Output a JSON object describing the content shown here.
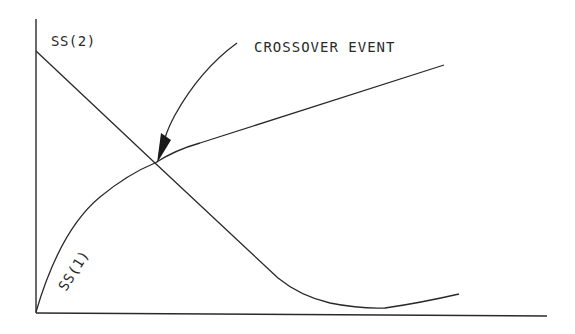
{
  "diagram": {
    "type": "line_diagram",
    "labels": {
      "ss2": "SS(2)",
      "ss1": "SS(1)",
      "annotation": "CROSSOVER EVENT"
    },
    "colors": {
      "line": "#2a2a2a",
      "background": "#ffffff"
    },
    "axes": {
      "x_label": "",
      "y_label": "",
      "ticks": false
    },
    "curves": [
      {
        "name": "SS(2)",
        "description": "starts high at y-axis, decreases linearly through crossover, flattens to a minimum, then rises slightly"
      },
      {
        "name": "SS(1)",
        "description": "starts at origin, rises concavely to crossover, then increases linearly"
      }
    ],
    "annotation_target": "intersection of SS(1) and SS(2)"
  }
}
